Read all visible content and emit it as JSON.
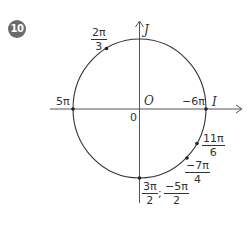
{
  "exercise": {
    "number": "10",
    "badge_color": "#6b6b6b"
  },
  "diagram": {
    "type": "trigonometric-unit-circle",
    "line_color": "#333333",
    "center": {
      "x": 139.5,
      "y": 109
    },
    "radius": 67,
    "axes": {
      "horizontal_label": "I",
      "vertical_label": "J",
      "origin_label": "O",
      "origin_value": "0"
    },
    "points": [
      {
        "name": "5pi",
        "label": "5π",
        "angle": "π"
      },
      {
        "name": "minus-6pi",
        "label": "−6π",
        "angle": "0"
      },
      {
        "name": "2pi-over-3",
        "numerator": "2π",
        "denominator": "3",
        "angle": "2π/3"
      },
      {
        "name": "11pi-over-6",
        "numerator": "11π",
        "denominator": "6",
        "angle": "11π/6"
      },
      {
        "name": "minus-7pi-over-4",
        "numerator": "−7π",
        "denominator": "4",
        "angle": "−7π/4"
      },
      {
        "name": "3pi-over-2-and-minus-5pi-over-2",
        "first": {
          "numerator": "3π",
          "denominator": "2"
        },
        "separator": ";",
        "second": {
          "numerator": "−5π",
          "denominator": "2"
        },
        "angle": "3π/2"
      }
    ]
  }
}
